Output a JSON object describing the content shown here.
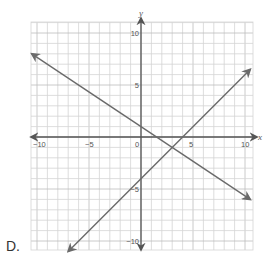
{
  "choice": {
    "label": "D."
  },
  "chart_data": {
    "type": "line",
    "title": "",
    "xlabel": "x",
    "ylabel": "y",
    "xlim": [
      -10,
      10
    ],
    "ylim": [
      -10,
      10
    ],
    "grid": true,
    "grid_step": 1,
    "x_ticks": [
      {
        "value": -10,
        "label": "−10"
      },
      {
        "value": -5,
        "label": "−5"
      },
      {
        "value": 0,
        "label": "0"
      },
      {
        "value": 5,
        "label": "5"
      },
      {
        "value": 10,
        "label": "10"
      }
    ],
    "y_ticks": [
      {
        "value": 10,
        "label": "10"
      },
      {
        "value": 5,
        "label": "5"
      },
      {
        "value": -5,
        "label": "−5"
      },
      {
        "value": -10,
        "label": "−10"
      }
    ],
    "series": [
      {
        "name": "line-1",
        "equation": "y = -2/3 x + 1",
        "slope": -0.6667,
        "intercept": 1,
        "x": [
          -10.5,
          10.5
        ],
        "y": [
          8,
          -6
        ],
        "color": "#666666"
      },
      {
        "name": "line-2",
        "equation": "y = x - 4",
        "slope": 1,
        "intercept": -4,
        "x": [
          -7,
          10.5
        ],
        "y": [
          -11,
          6.5
        ],
        "color": "#666666"
      }
    ],
    "intersection": {
      "x": 3,
      "y": -1
    },
    "legend": null
  },
  "colors": {
    "grid": "#d4d4d4",
    "grid_major": "#bdbdbd",
    "axis": "#555555",
    "line": "#6a6a6a"
  }
}
